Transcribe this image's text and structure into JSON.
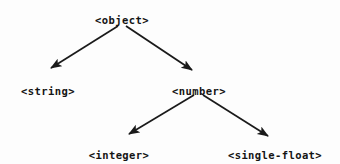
{
  "diagram": {
    "type": "tree",
    "title": "",
    "background_color": "#fdfdfd",
    "line_color": "#1a1a1a",
    "text_color": "#141414",
    "nodes": [
      {
        "id": "object",
        "label": "<object>",
        "x": 122,
        "y": 14,
        "level": 0
      },
      {
        "id": "string",
        "label": "<string>",
        "x": 48,
        "y": 85,
        "level": 1
      },
      {
        "id": "number",
        "label": "<number>",
        "x": 199,
        "y": 85,
        "level": 1
      },
      {
        "id": "integer",
        "label": "<integer>",
        "x": 119,
        "y": 149,
        "level": 2
      },
      {
        "id": "single-float",
        "label": "<single-float>",
        "x": 275,
        "y": 149,
        "level": 2
      }
    ],
    "edges": [
      {
        "from": "object",
        "to": "string",
        "x1": 118,
        "y1": 26,
        "x2": 51,
        "y2": 68,
        "arrow": true
      },
      {
        "from": "object",
        "to": "number",
        "x1": 126,
        "y1": 26,
        "x2": 192,
        "y2": 70,
        "arrow": true
      },
      {
        "from": "number",
        "to": "integer",
        "x1": 194,
        "y1": 95,
        "x2": 129,
        "y2": 134,
        "arrow": true
      },
      {
        "from": "number",
        "to": "single-float",
        "x1": 203,
        "y1": 95,
        "x2": 268,
        "y2": 136,
        "arrow": true
      }
    ]
  }
}
